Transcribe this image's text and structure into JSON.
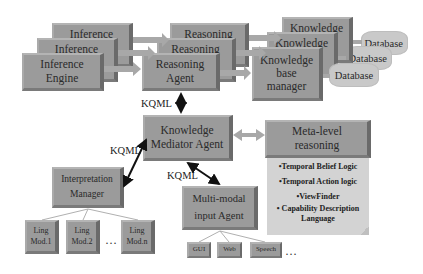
{
  "inference_stack": {
    "back_label": "Inference",
    "middle_label": "Inference",
    "front_label_line1": "Inference",
    "front_label_line2": "Engine"
  },
  "reasoning_stack": {
    "back_label": "Reasoning",
    "middle_label": "Reasoning",
    "front_label_line1": "Reasoning",
    "front_label_line2": "Agent"
  },
  "knowledge_stack": {
    "back_label": "Knowledge",
    "middle_label": "Knowledge",
    "front_label_line1": "Knowledge",
    "front_label_line2": "base",
    "front_label_line3": "manager"
  },
  "databases": [
    "Database",
    "Database",
    "Database"
  ],
  "mediator": {
    "line1": "Knowledge",
    "line2": "Mediator Agent"
  },
  "meta_level": {
    "line1": "Meta-level",
    "line2": "reasoning",
    "bullets": [
      "•Temporal Belief Logic",
      "•Temporal Action logic",
      "•ViewFinder",
      "• Capability Description Language"
    ]
  },
  "interpretation": {
    "line1": "Interpretation",
    "line2": "Manager"
  },
  "ling_modules": [
    {
      "line1": "Ling",
      "line2": "Mod.1"
    },
    {
      "line1": "Ling",
      "line2": "Mod.2"
    },
    {
      "line1": "Ling",
      "line2": "Mod.n"
    }
  ],
  "multimodal": {
    "line1": "Multi-modal",
    "line2": "input Agent"
  },
  "inputs": [
    "GUI",
    "Web",
    "Speech"
  ],
  "ellipsis": "…",
  "connectors": {
    "kqml_top": "KQML",
    "kqml_left": "KQML",
    "kqml_bottom": "KQML"
  },
  "colors": {
    "box": "#9b9b9b",
    "note": "#d3d3d3",
    "database": "#c9c9c9",
    "arrow_gray": "#a8a8a8",
    "arrow_black": "#111111"
  }
}
